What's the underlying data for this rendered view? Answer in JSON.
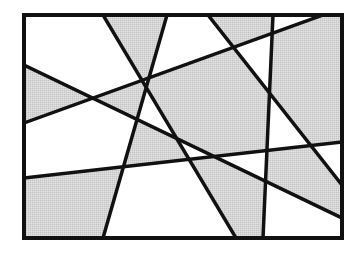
{
  "figure": {
    "rectangle": {
      "x": 24,
      "y": 15,
      "width": 318,
      "height": 223
    },
    "colors": {
      "shade": "#d4d4d4",
      "background": "#ffffff",
      "stroke": "#111111"
    },
    "stroke_width": 3.5,
    "lines": [
      {
        "id": "line-1",
        "x1": 103,
        "y1": 15,
        "x2": 236,
        "y2": 238
      },
      {
        "id": "line-2",
        "x1": 167,
        "y1": 15,
        "x2": 103,
        "y2": 238
      },
      {
        "id": "line-3",
        "x1": 24,
        "y1": 65,
        "x2": 342,
        "y2": 218
      },
      {
        "id": "line-4",
        "x1": 24,
        "y1": 123,
        "x2": 323,
        "y2": 15
      },
      {
        "id": "line-5",
        "x1": 208,
        "y1": 15,
        "x2": 342,
        "y2": 185
      },
      {
        "id": "line-6",
        "x1": 273,
        "y1": 15,
        "x2": 263,
        "y2": 238
      },
      {
        "id": "line-7",
        "x1": 24,
        "y1": 178,
        "x2": 342,
        "y2": 142
      }
    ],
    "half_planes": [
      "103,15 342,15 342,238 236,238",
      "167,15 342,15 342,238 103,238",
      "24,65 342,218 342,238 24,238",
      "24,123 323,15 342,15 342,238 24,238",
      "208,15 342,15 342,185",
      "273,15 342,15 342,238 263,238",
      "24,178 342,142 342,238 24,238"
    ]
  }
}
